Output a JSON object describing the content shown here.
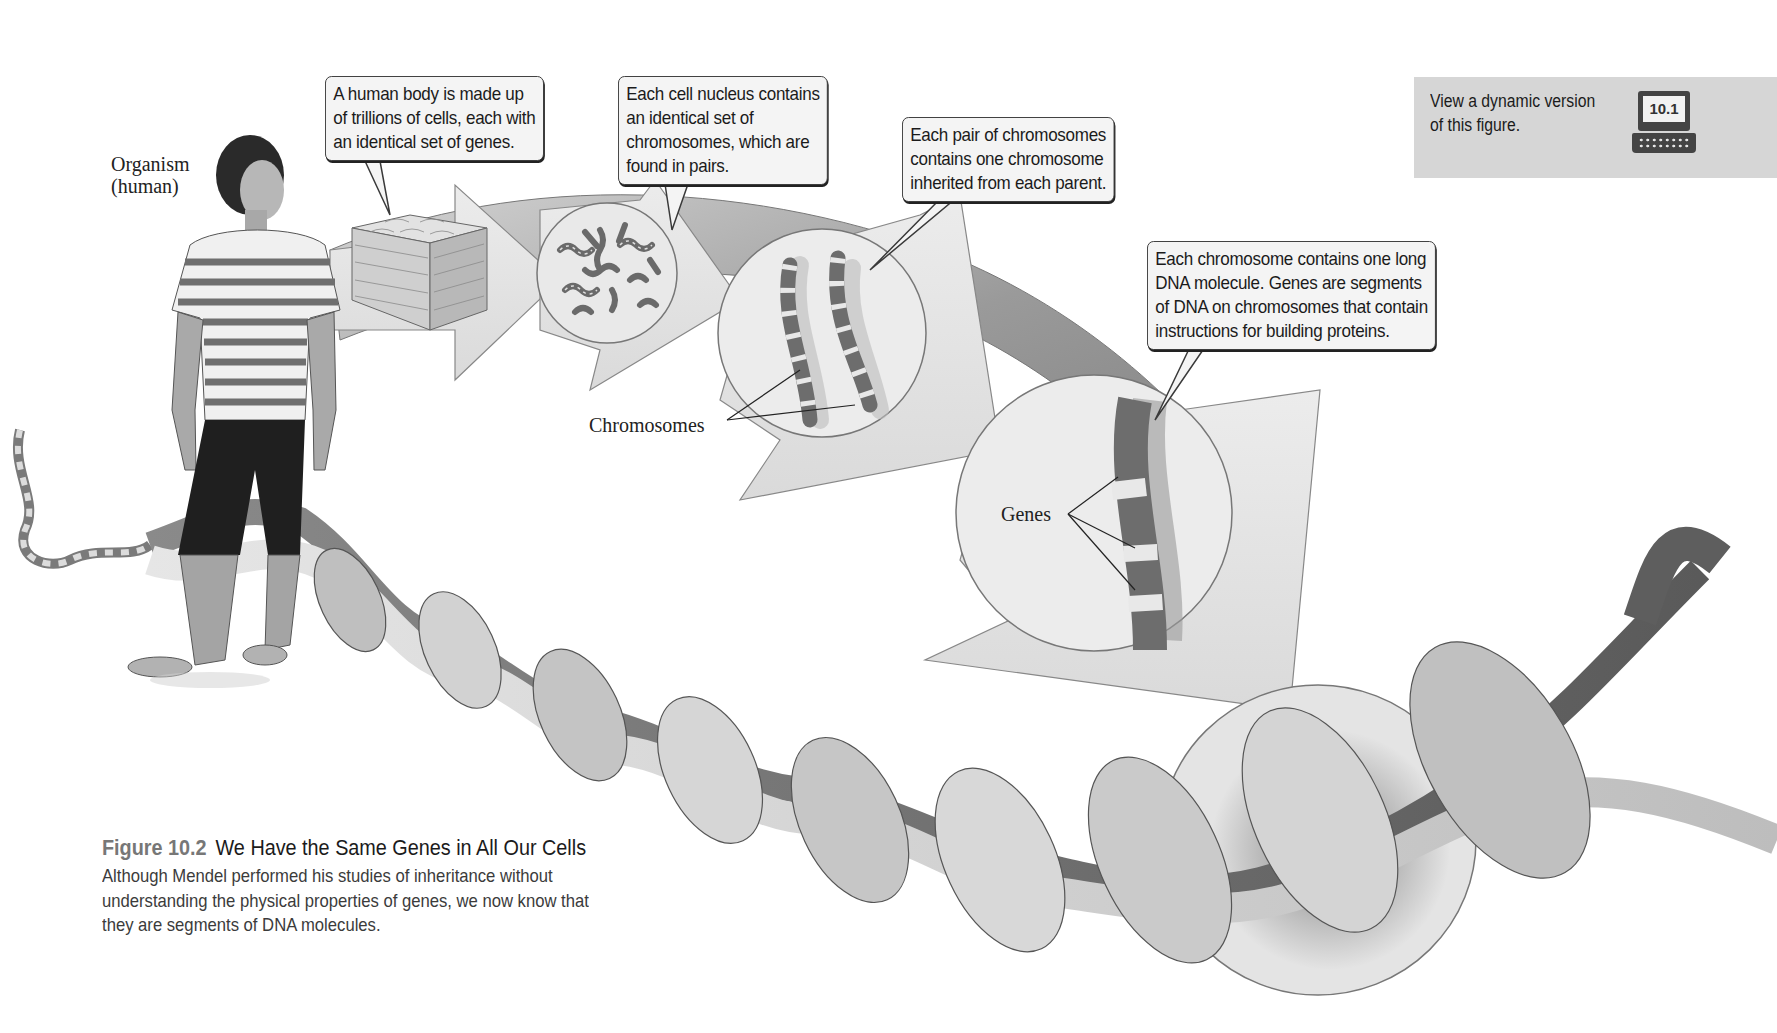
{
  "figure": {
    "number_label": "Figure 10.2",
    "title": "We Have the Same Genes in All Our Cells",
    "caption_lines": [
      "Although Mendel performed his studies of inheritance without",
      "understanding the physical properties of genes, we now know that",
      "they are segments of DNA molecules."
    ]
  },
  "labels": {
    "organism": [
      "Organism",
      "(human)"
    ],
    "chromosomes": "Chromosomes",
    "genes": "Genes"
  },
  "callouts": [
    {
      "id": "body-cells",
      "lines": [
        "A human body is made up",
        "of trillions of cells, each with",
        "an identical set of genes."
      ]
    },
    {
      "id": "cell-nucleus",
      "lines": [
        "Each cell nucleus contains",
        "an identical set of",
        "chromosomes, which are",
        "found in pairs."
      ]
    },
    {
      "id": "chromosome-pair",
      "lines": [
        "Each pair of chromosomes",
        "contains one chromosome",
        "inherited from each parent."
      ]
    },
    {
      "id": "dna-genes",
      "lines": [
        "Each chromosome contains one long",
        "DNA molecule. Genes are segments",
        "of DNA on chromosomes that contain",
        "instructions for building proteins."
      ]
    }
  ],
  "dynamic_version": {
    "lines": [
      "View a dynamic version",
      "of this figure."
    ],
    "badge": "10.1",
    "icon": "laptop-icon"
  },
  "colors": {
    "background": "#ffffff",
    "callout_fill": "#f4f4f4",
    "arrow_light": "#e8e8e8",
    "arrow_dark": "#8a8a8a",
    "dna_light": "#d9d9d9",
    "dna_dark": "#6b6b6b",
    "dynamic_box": "#d6d6d6",
    "figure_number": "#777777"
  }
}
